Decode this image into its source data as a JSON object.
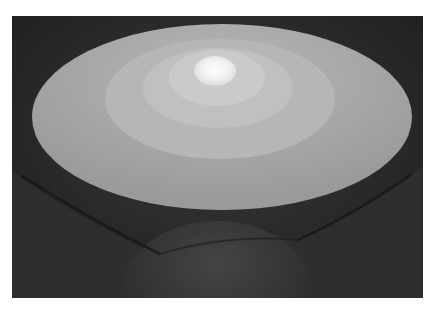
{
  "image": {
    "description": "Grayscale photograph looking up at a domed ceiling with concentric illuminated elliptical rings and a bright central oculus",
    "colors": {
      "border": "#ffffff",
      "background_dark": "#2a2a2a",
      "outer_ring": "#a9a9a9",
      "ring_2": "#b4b4b4",
      "ring_3": "#bebebe",
      "ring_4": "#c8c8c8",
      "center_light": "#f2f2f2"
    }
  }
}
